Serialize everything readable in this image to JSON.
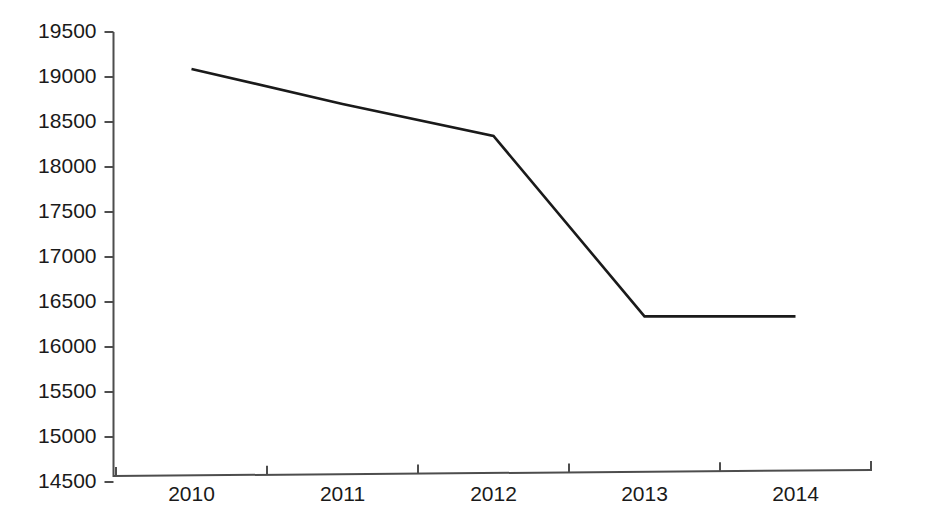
{
  "chart_data": {
    "type": "line",
    "title": "",
    "subtitle": "",
    "xlabel": "",
    "ylabel": "",
    "categories": [
      "2010",
      "2011",
      "2012",
      "2013",
      "2014"
    ],
    "series": [
      {
        "name": "",
        "values": [
          19090,
          18700,
          18345,
          16340,
          16340
        ]
      }
    ],
    "ytick_labels": [
      "19500",
      "19000",
      "18500",
      "18000",
      "17500",
      "17000",
      "16500",
      "16000",
      "15500",
      "15000",
      "14500"
    ],
    "ytick_values": [
      19500,
      19000,
      18500,
      18000,
      17500,
      17000,
      16500,
      16000,
      15500,
      15000,
      14500
    ],
    "ylim": [
      14500,
      19500
    ],
    "grid": false,
    "legend": "none",
    "line_color": "#1a1a1a",
    "axis_color": "#4d4d4d",
    "background_color": "#ffffff"
  },
  "axes": {
    "y_axis_name": "y-axis",
    "x_axis_name": "x-axis"
  }
}
